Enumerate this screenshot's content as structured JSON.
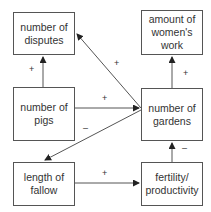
{
  "diagram": {
    "type": "causal-loop",
    "nodes": [
      {
        "id": "disputes",
        "label": "number of disputes"
      },
      {
        "id": "womens_work",
        "label": "amount of women's work"
      },
      {
        "id": "pigs",
        "label": "number of pigs"
      },
      {
        "id": "gardens",
        "label": "number of gardens"
      },
      {
        "id": "fallow",
        "label": "length of fallow"
      },
      {
        "id": "fertility",
        "label": "fertility/ productivity"
      }
    ],
    "edges": [
      {
        "from": "pigs",
        "to": "disputes",
        "sign": "+"
      },
      {
        "from": "gardens",
        "to": "disputes",
        "sign": "+"
      },
      {
        "from": "pigs",
        "to": "gardens",
        "sign": "+"
      },
      {
        "from": "gardens",
        "to": "womens_work",
        "sign": "+"
      },
      {
        "from": "gardens",
        "to": "fallow",
        "sign": "–"
      },
      {
        "from": "fallow",
        "to": "fertility",
        "sign": "+"
      },
      {
        "from": "fertility",
        "to": "gardens",
        "sign": "–"
      }
    ]
  }
}
